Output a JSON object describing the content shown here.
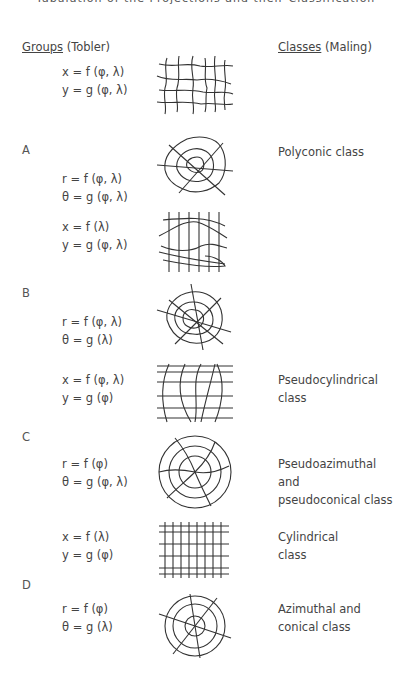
{
  "page": {
    "top_caption": "Tabulation of the Projections and their Classification"
  },
  "headers": {
    "left_underlined": "Groups",
    "left_rest": "(Tobler)",
    "right_underlined": "Classes",
    "right_rest": "(Maling)"
  },
  "groups": [
    {
      "label": "A",
      "rows": [
        {
          "eq1": "x = f (φ, λ)",
          "eq2": "y = g (φ, λ)",
          "figure": "irregular-grid",
          "class_line1": "",
          "class_line2": ""
        },
        {
          "eq1": "r = f (φ, λ)",
          "eq2": "θ = g (φ, λ)",
          "figure": "irregular-web",
          "class_line1": "Polyconic class",
          "class_line2": ""
        }
      ]
    },
    {
      "label": "B",
      "rows": [
        {
          "eq1": "x = f (λ)",
          "eq2": "y = g (φ, λ)",
          "figure": "straight-meridians-curved-parallels",
          "class_line1": "",
          "class_line2": ""
        },
        {
          "eq1": "r = f (φ, λ)",
          "eq2": "θ = g (λ)",
          "figure": "irregular-rings-straight-radials",
          "class_line1": "",
          "class_line2": ""
        }
      ]
    },
    {
      "label": "C",
      "rows": [
        {
          "eq1": "x = f (φ, λ)",
          "eq2": "y = g (φ)",
          "figure": "pseudocylindrical-grid",
          "class_line1": "Pseudocylindrical",
          "class_line2": "class"
        },
        {
          "eq1": "r = f (φ)",
          "eq2": "θ = g (φ, λ)",
          "figure": "spiral-circles",
          "class_line1": "Pseudoazimuthal and",
          "class_line2": "pseudoconical class"
        }
      ]
    },
    {
      "label": "D",
      "rows": [
        {
          "eq1": "x = f (λ)",
          "eq2": "y = g (φ)",
          "figure": "rectangular-grid",
          "class_line1": "Cylindrical",
          "class_line2": "class"
        },
        {
          "eq1": "r = f (φ)",
          "eq2": "θ = g (λ)",
          "figure": "concentric-circles-radials",
          "class_line1": "Azimuthal and",
          "class_line2": "conical class"
        }
      ]
    }
  ]
}
